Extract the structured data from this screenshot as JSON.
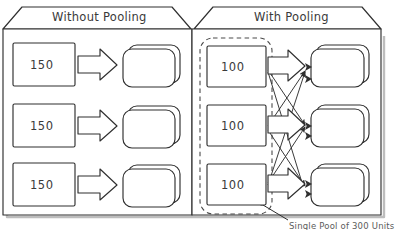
{
  "diagram": {
    "title_left": "Without Pooling",
    "title_right": "With Pooling",
    "caption": "Single Pool of 300 Units",
    "colors": {
      "stroke": "#2f2f2f",
      "shadow": "#b9b9b9",
      "text": "#3a3a3a",
      "dashed": "#4a4a4a",
      "background": "#ffffff"
    },
    "left_panel": {
      "name": "without-pooling",
      "sources": [
        {
          "value": "150"
        },
        {
          "value": "150"
        },
        {
          "value": "150"
        }
      ],
      "targets": [
        {
          "label": ""
        },
        {
          "label": ""
        },
        {
          "label": ""
        }
      ],
      "arrow_style": "block-arrow",
      "connections": "one-to-one"
    },
    "right_panel": {
      "name": "with-pooling",
      "pool_boundary": "dashed",
      "sources": [
        {
          "value": "100"
        },
        {
          "value": "100"
        },
        {
          "value": "100"
        }
      ],
      "targets": [
        {
          "label": ""
        },
        {
          "label": ""
        },
        {
          "label": ""
        }
      ],
      "arrow_style": "block-arrow-plus-crosslinks",
      "connections": "many-to-many"
    }
  }
}
